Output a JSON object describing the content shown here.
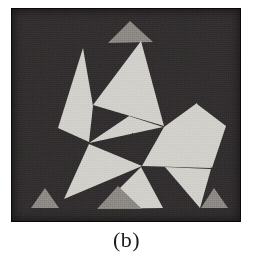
{
  "figure": {
    "caption": "(b)",
    "alt_label": "illusory-triangle-figure",
    "panel": {
      "x": 11,
      "y": 8,
      "width": 230,
      "height": 214,
      "background_color": "#231f20",
      "border_color": "#0d0b0c"
    },
    "colors": {
      "background_dark": "#231f20",
      "tile_light": "#d2d0cb",
      "tile_mid_gray": "#8d8a86",
      "paper_white": "#ffffff",
      "caption_ink": "#1b1b1b"
    },
    "shapes": [
      {
        "name": "top-apex-tile",
        "fill": "tile_mid_gray",
        "points": "119,13 142,34 97,35"
      },
      {
        "name": "upper-large-tile",
        "fill": "tile_light",
        "points": "130,33 153,118 82,97"
      },
      {
        "name": "upper-left-wedge",
        "fill": "tile_light",
        "points": "82,98 72,40 47,120 78,134"
      },
      {
        "name": "center-left-arrow",
        "fill": "tile_light",
        "points": "78,135 118,108 152,119"
      },
      {
        "name": "center-right-tile",
        "fill": "tile_light",
        "points": "153,119 186,95 200,160 131,158"
      },
      {
        "name": "right-upper-tile",
        "fill": "tile_light",
        "points": "186,96 160,118 201,160 215,118"
      },
      {
        "name": "lower-left-large-tile",
        "fill": "tile_light",
        "points": "78,136 131,158 53,191"
      },
      {
        "name": "lower-center-tile",
        "fill": "tile_light",
        "points": "130,159 152,200 88,201"
      },
      {
        "name": "lower-right-large-tile",
        "fill": "tile_light",
        "points": "154,159 200,161 189,200"
      },
      {
        "name": "bottom-center-gray",
        "fill": "tile_mid_gray",
        "points": "107,178 131,201 86,201"
      },
      {
        "name": "bottom-left-corner-tile",
        "fill": "tile_mid_gray",
        "points": "34,180 48,200 20,200"
      },
      {
        "name": "bottom-right-corner-tile",
        "fill": "tile_mid_gray",
        "points": "203,180 217,200 190,200"
      }
    ]
  },
  "chart_data": {
    "type": "diagram",
    "title": "(b)",
    "panel_count": 1,
    "tile_counts": {
      "light_tiles": 9,
      "mid_gray_tiles": 4,
      "total_tiles": 13
    },
    "legend": []
  }
}
